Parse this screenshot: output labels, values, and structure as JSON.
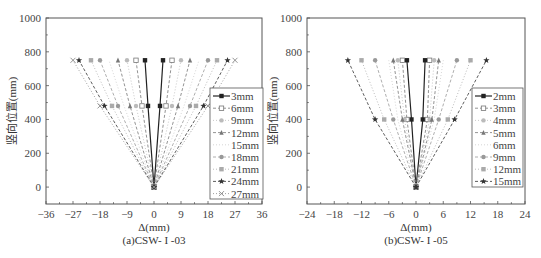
{
  "chart_data": [
    {
      "type": "line",
      "title": "(a)CSW- I -03",
      "xlabel": "Δ(mm)",
      "ylabel": "竖向位置(mm)",
      "xlim": [
        -36,
        36
      ],
      "ylim": [
        -100,
        1000
      ],
      "xticks": [
        -36,
        -27,
        -18,
        -9,
        0,
        9,
        18,
        27,
        36
      ],
      "yticks": [
        0,
        200,
        400,
        600,
        800,
        1000
      ],
      "grid": false,
      "legend_position": "right-inside",
      "y": [
        0,
        480,
        750
      ],
      "series": [
        {
          "name": "3mm",
          "marker": "square-filled",
          "color": "#222222",
          "dash": "",
          "left": [
            0,
            -2,
            -3
          ],
          "right": [
            0,
            2,
            3
          ]
        },
        {
          "name": "6mm",
          "marker": "square-open",
          "color": "#777777",
          "dash": "3,2",
          "left": [
            0,
            -4,
            -6
          ],
          "right": [
            0,
            4,
            6
          ]
        },
        {
          "name": "9mm",
          "marker": "circle",
          "color": "#bbbbbb",
          "dash": "1,2",
          "left": [
            0,
            -6,
            -9
          ],
          "right": [
            0,
            6,
            9
          ]
        },
        {
          "name": "12mm",
          "marker": "triangle",
          "color": "#777777",
          "dash": "3,2",
          "left": [
            0,
            -8,
            -12
          ],
          "right": [
            0,
            8,
            12
          ]
        },
        {
          "name": "15mm",
          "marker": "none",
          "color": "#cccccc",
          "dash": "1,2",
          "left": [
            0,
            -10,
            -15
          ],
          "right": [
            0,
            10,
            15
          ]
        },
        {
          "name": "18mm",
          "marker": "circle",
          "color": "#999999",
          "dash": "3,2",
          "left": [
            0,
            -12,
            -18
          ],
          "right": [
            0,
            12,
            18
          ]
        },
        {
          "name": "21mm",
          "marker": "square-gray",
          "color": "#aaaaaa",
          "dash": "1,2",
          "left": [
            0,
            -14,
            -21
          ],
          "right": [
            0,
            14,
            21
          ]
        },
        {
          "name": "24mm",
          "marker": "star",
          "color": "#333333",
          "dash": "3,2",
          "left": [
            0,
            -16.5,
            -25
          ],
          "right": [
            0,
            16.5,
            24.5
          ]
        },
        {
          "name": "27mm",
          "marker": "x",
          "color": "#888888",
          "dash": "1,2",
          "left": [
            0,
            -18,
            -27
          ],
          "right": [
            0,
            18,
            27
          ]
        }
      ]
    },
    {
      "type": "line",
      "title": "(b)CSW- I -05",
      "xlabel": "Δ(mm)",
      "ylabel": "竖向位置(mm)",
      "xlim": [
        -24,
        24
      ],
      "ylim": [
        -100,
        1000
      ],
      "xticks": [
        -24,
        -18,
        -12,
        -6,
        0,
        6,
        12,
        18,
        24
      ],
      "yticks": [
        0,
        200,
        400,
        600,
        800,
        1000
      ],
      "grid": false,
      "legend_position": "right-inside",
      "y": [
        0,
        400,
        750
      ],
      "series": [
        {
          "name": "2mm",
          "marker": "square-filled",
          "color": "#222222",
          "dash": "",
          "left": [
            0,
            -1,
            -2
          ],
          "right": [
            0,
            1.5,
            2
          ]
        },
        {
          "name": "3mm",
          "marker": "square-open",
          "color": "#777777",
          "dash": "3,2",
          "left": [
            0,
            -2,
            -3
          ],
          "right": [
            0,
            2.5,
            3
          ]
        },
        {
          "name": "4mm",
          "marker": "circle",
          "color": "#bbbbbb",
          "dash": "1,2",
          "left": [
            0,
            -2.5,
            -4
          ],
          "right": [
            0,
            3,
            4
          ]
        },
        {
          "name": "5mm",
          "marker": "triangle",
          "color": "#777777",
          "dash": "3,2",
          "left": [
            0,
            -3,
            -5
          ],
          "right": [
            0,
            3.5,
            5
          ]
        },
        {
          "name": "6mm",
          "marker": "none",
          "color": "#cccccc",
          "dash": "1,2",
          "left": [
            0,
            -4,
            -6
          ],
          "right": [
            0,
            4,
            6
          ]
        },
        {
          "name": "9mm",
          "marker": "circle",
          "color": "#999999",
          "dash": "3,2",
          "left": [
            0,
            -5,
            -9
          ],
          "right": [
            0,
            5,
            9
          ]
        },
        {
          "name": "12mm",
          "marker": "square-gray",
          "color": "#aaaaaa",
          "dash": "1,2",
          "left": [
            0,
            -7,
            -12
          ],
          "right": [
            0,
            7,
            12
          ]
        },
        {
          "name": "15mm",
          "marker": "star",
          "color": "#333333",
          "dash": "3,2",
          "left": [
            0,
            -9,
            -15
          ],
          "right": [
            0,
            8.5,
            15.5
          ]
        }
      ]
    }
  ]
}
